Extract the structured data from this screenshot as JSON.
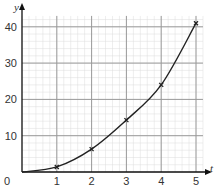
{
  "chart_data": {
    "type": "line",
    "title": "",
    "xlabel": "t",
    "ylabel": "y",
    "x": [
      1,
      2,
      3,
      4,
      5
    ],
    "series": [
      {
        "name": "y",
        "values": [
          1.4,
          6.3,
          14.3,
          24,
          41
        ],
        "marker": "x"
      }
    ],
    "curve_through_origin": true,
    "xlim": [
      0,
      5.2
    ],
    "ylim": [
      0,
      43
    ],
    "x_ticks": [
      "0",
      "1",
      "2",
      "3",
      "4",
      "5"
    ],
    "y_ticks": [
      "10",
      "20",
      "30",
      "40"
    ],
    "grid": true,
    "grid_major_x": 1,
    "grid_major_y": 10,
    "grid_minor_x": 0.2,
    "grid_minor_y": 2,
    "legend": "none",
    "colors": {
      "curve": "#222222",
      "major_grid": "#9a9a9a",
      "minor_grid": "#dddddd",
      "axis": "#111111"
    }
  },
  "labels": {
    "origin": "0",
    "x_axis": "t",
    "y_axis": "y"
  }
}
